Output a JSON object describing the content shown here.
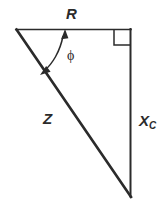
{
  "figure": {
    "background_color": "#ffffff",
    "stroke_color": "#2b2b2b",
    "labels": {
      "resistance": "R",
      "impedance": "Z",
      "reactance_base": "X",
      "reactance_sub": "C",
      "phase_angle": "ϕ"
    },
    "geometry": {
      "left_vertex": "16,29",
      "top_right_vertex": "131,29",
      "bottom_right_vertex": "131,196",
      "right_angle_marker": "top-right",
      "angle_arc": "at left vertex between R and Z"
    }
  }
}
